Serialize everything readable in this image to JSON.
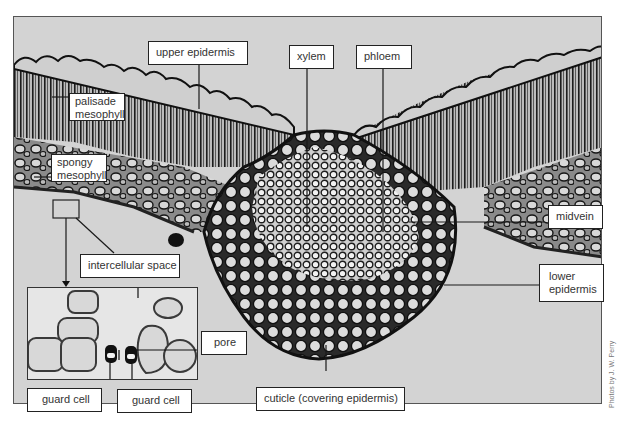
{
  "figure": {
    "credit": "Photos by J. W. Perry"
  },
  "labels": {
    "upper_epidermis": "upper epidermis",
    "xylem": "xylem",
    "phloem": "phloem",
    "palisade_mesophyll": "palisade mesophyll",
    "spongy_mesophyll": "spongy mesophyll",
    "midvein": "midvein",
    "lower_epidermis": "lower epidermis",
    "intercellular_space": "intercellular space",
    "pore": "pore",
    "guard_cell_left": "guard cell",
    "guard_cell_right": "guard cell",
    "cuticle": "cuticle (covering epidermis)"
  },
  "colors": {
    "background": "#d3d3d3",
    "tissue_dark": "#2a2a2a",
    "label_border": "#222222",
    "label_text": "#333333"
  }
}
